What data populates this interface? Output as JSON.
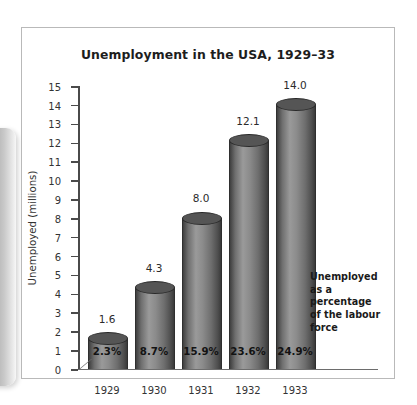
{
  "figure": {
    "title": "Unemployment in the USA, 1929–33",
    "annotation_lines": [
      "Unemployed",
      "as a percentage",
      "of the labour",
      "force"
    ],
    "colors": {
      "bar_dark": "#3a3a3a",
      "bar_light": "#9a9a9a",
      "bar_top": "#555555",
      "axis": "#4a4a4a",
      "panel_border": "#b9b9b9",
      "background": "#ffffff",
      "text": "#2b2b2b"
    }
  },
  "chart_data": {
    "type": "bar",
    "title": "Unemployment in the USA, 1929–33",
    "xlabel": "",
    "ylabel": "Unemployed (millions)",
    "ylim": [
      0,
      15
    ],
    "yticks": [
      0,
      1,
      2,
      3,
      4,
      5,
      6,
      7,
      8,
      9,
      10,
      11,
      12,
      13,
      14,
      15
    ],
    "ytick_labels": [
      "0",
      "1",
      "2",
      "3",
      "4",
      "5",
      "6",
      "7",
      "8",
      "9",
      "10",
      "11",
      "12",
      "13",
      "14",
      "15"
    ],
    "grid": false,
    "legend": null,
    "categories": [
      "1929",
      "1930",
      "1931",
      "1932",
      "1933"
    ],
    "values": [
      1.6,
      4.3,
      8.0,
      12.1,
      14.0
    ],
    "value_labels": [
      "1.6",
      "4.3",
      "8.0",
      "12.1",
      "14.0"
    ],
    "secondary_series": {
      "name": "Unemployed as a percentage of the labour force",
      "values": [
        2.3,
        8.7,
        15.9,
        23.6,
        24.9
      ],
      "labels": [
        "2.3%",
        "8.7%",
        "15.9%",
        "23.6%",
        "24.9%"
      ]
    },
    "annotation": "Unemployed as a percentage of the labour force"
  }
}
